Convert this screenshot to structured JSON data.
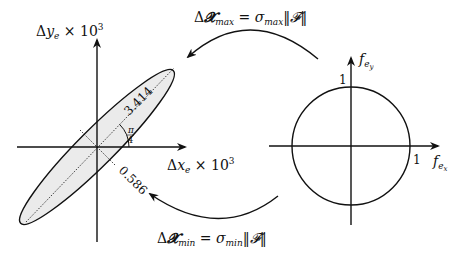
{
  "left_plot": {
    "y_axis_label": "Δy_e × 10³",
    "y_axis_label_parts": {
      "delta": "Δ",
      "var": "y",
      "sub": "e",
      "times": " × 10",
      "sup": "3"
    },
    "x_axis_label_parts": {
      "delta": "Δ",
      "var": "x",
      "sub": "e",
      "times": " × 10",
      "sup": "3"
    },
    "major_axis_label": "3.414",
    "minor_axis_label": "0.586",
    "angle_label_num": "π",
    "angle_label_den": "4",
    "ellipse_fill": "#ebebeb"
  },
  "right_plot": {
    "y_axis_label_parts": {
      "var": "f",
      "sub": "e",
      "subsub": "y"
    },
    "x_axis_label_parts": {
      "var": "f",
      "sub": "e",
      "subsub": "x"
    },
    "y_tick": "1",
    "x_tick": "1"
  },
  "top_arrow_label": {
    "delta": "Δ",
    "X": "𝓧",
    "sub": "max",
    "eq": " = ",
    "sigma": "σ",
    "sigma_sub": "max",
    "norm": "‖𝓕‖"
  },
  "bottom_arrow_label": {
    "delta": "Δ",
    "X": "𝓧",
    "sub": "min",
    "eq": " = ",
    "sigma": "σ",
    "sigma_sub": "min",
    "norm": "‖𝓕‖"
  },
  "colors": {
    "stroke": "#111111",
    "fill": "#ebebeb"
  }
}
